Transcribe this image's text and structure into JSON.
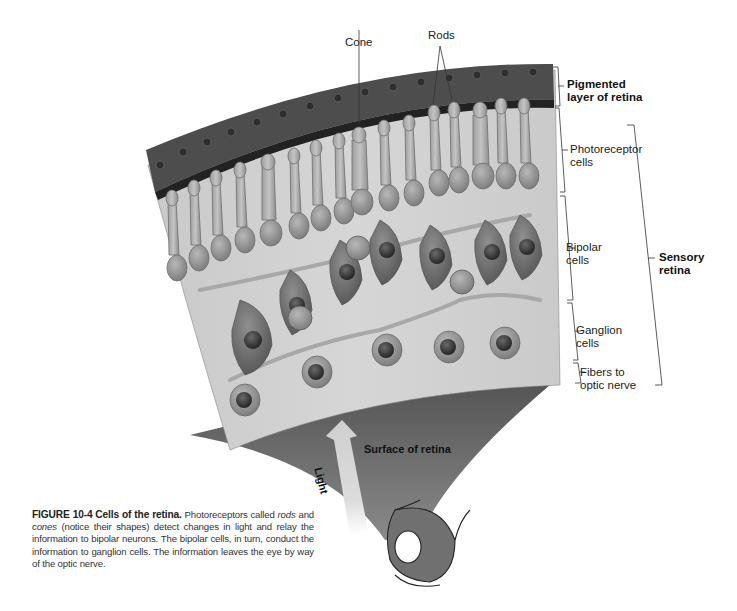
{
  "figure": {
    "number": "FIGURE 10-4",
    "title": "Cells of the retina.",
    "caption_parts": {
      "p1": "Photoreceptors called ",
      "rods": "rods",
      "p2": " and ",
      "cones": "cones",
      "p3": " (notice their shapes) detect changes in light and relay the information to bipolar neurons. The bipolar cells, in turn, conduct the information to ganglion cells. The information leaves the eye by way of the optic nerve."
    }
  },
  "labels": {
    "cone": "Cone",
    "rods": "Rods",
    "pigmented_layer": "Pigmented\nlayer of retina",
    "photoreceptor_cells": "Photoreceptor\ncells",
    "bipolar_cells": "Bipolar\ncells",
    "ganglion_cells": "Ganglion\ncells",
    "fibers": "Fibers to\noptic nerve",
    "sensory_retina": "Sensory\nretina",
    "surface": "Surface of retina",
    "light": "Light"
  },
  "colors": {
    "tissue_bg": "#cfcfcf",
    "pigment": "#4a4a4a",
    "surface": "#5a5a5a",
    "cell": "#9a9a9a",
    "nucleus": "#3a3a3a"
  }
}
